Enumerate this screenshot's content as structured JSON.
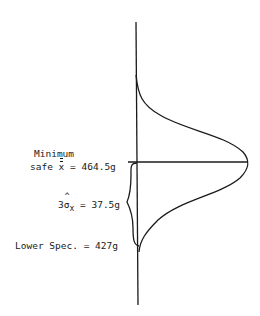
{
  "diagram": {
    "type": "normal-distribution-spec-limit",
    "labels": {
      "minimum_line1": "Minimum",
      "minimum_line2_prefix": "safe ",
      "minimum_symbol": "x",
      "minimum_value": " = 464.5g",
      "sigma_prefix": "3",
      "sigma_symbol": "σ",
      "sigma_sub": "x",
      "sigma_value": " = 37.5g",
      "lower_spec": "Lower Spec. = 427g"
    },
    "values": {
      "minimum_safe_mean_g": 464.5,
      "three_sigma_g": 37.5,
      "lower_spec_g": 427
    },
    "colors": {
      "ink": "#1a1a1a",
      "background": "#ffffff"
    }
  }
}
